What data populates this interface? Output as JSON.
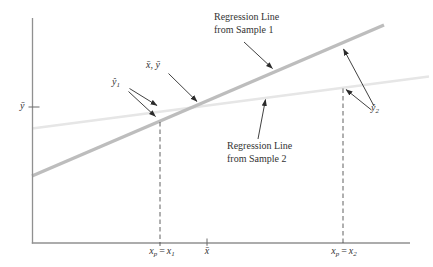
{
  "colors": {
    "background": "#ffffff",
    "axis": "#909090",
    "tick": "#6a6a6a",
    "sample1_line": "#bdbdbd",
    "sample2_line": "#e6e6e6",
    "dashed": "#4f4f4f",
    "arrow": "#2b2b2b",
    "text": "#333333"
  },
  "labels": {
    "sample1": {
      "line1": "Regression Line",
      "line2": "from Sample 1"
    },
    "sample2": {
      "line1": "Regression Line",
      "line2": "from Sample 2"
    },
    "xy_mean": "x̄, ȳ",
    "yhat1": {
      "base": "ŷ",
      "sub": "1"
    },
    "yhat2": {
      "base": "ŷ",
      "sub": "2"
    },
    "ybar_axis": "ȳ",
    "x1": {
      "a": "x",
      "asub": "p",
      "eq": "=",
      "b": "x",
      "bsub": "1"
    },
    "xbar": "x̄",
    "x2": {
      "a": "x",
      "asub": "p",
      "eq": "=",
      "b": "x",
      "bsub": "2"
    }
  }
}
